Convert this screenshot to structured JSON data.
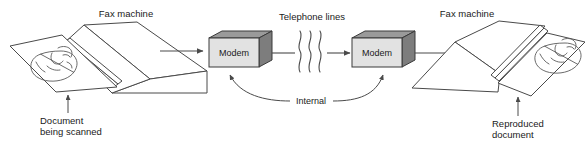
{
  "diagram": {
    "background_color": "#ffffff",
    "line_color": "#4a4a4a",
    "text_color": "#1a1a1a",
    "labels": {
      "fax_left": "Fax machine",
      "fax_right": "Fax machine",
      "document_scanned_line1": "Document",
      "document_scanned_line2": "being scanned",
      "reproduced_line1": "Reproduced",
      "reproduced_line2": "document",
      "telephone_lines": "Telephone lines",
      "internal": "Internal",
      "modem_left": "Modem",
      "modem_right": "Modem"
    },
    "modem_colors": {
      "front": "#e2e2e2",
      "top": "#9a9a9a",
      "side": "#7d7d7d",
      "outline": "#3a3a3a"
    },
    "icons": {
      "face_sketch_left": "face-profile-sketch-icon",
      "face_sketch_right": "face-profile-sketch-icon",
      "squiggle": "telephone-line-squiggle-icon",
      "arrow_right": "arrow-right-icon",
      "arrow_up": "arrow-up-icon"
    }
  }
}
